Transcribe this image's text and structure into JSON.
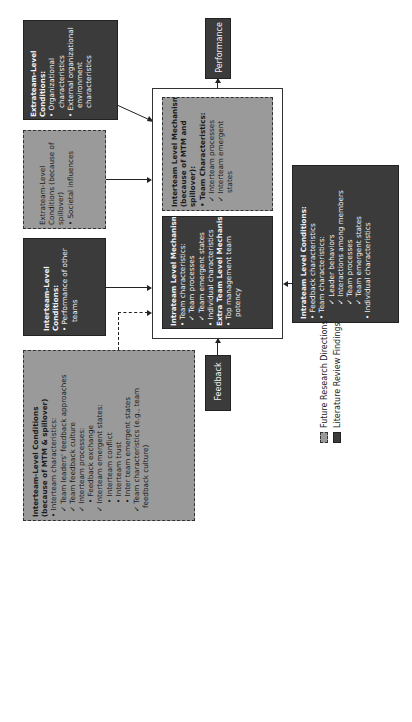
{
  "orientation": "rotated-90-ccw",
  "colors": {
    "literature_review_fill": "#3b3b3b",
    "future_research_fill": "#9a9a9a",
    "background": "#ffffff"
  },
  "outcome": {
    "label": "Performance"
  },
  "input": {
    "label": "Feedback"
  },
  "extrateam_conditions": {
    "title": "Extrateam-Level Conditions:",
    "items": [
      "• Organizational",
      "characteristics",
      "• External organizational",
      "environment",
      "characteristics"
    ]
  },
  "extrateam_spillover": {
    "title_1": "Extrateam-Level",
    "title_2": "Conditions (because of",
    "title_3": "spillover)",
    "items": [
      "• Societal influences"
    ]
  },
  "interteam_conditions": {
    "title_1": "Interteam-Level",
    "title_2": "Conditions:",
    "items": [
      "• Performance of other",
      "teams"
    ]
  },
  "interteam_mtm_conditions": {
    "title_1": "Interteam-Level Conditions",
    "title_2": "(because of MTM & spillover)",
    "items": [
      "• Interteam characteristics:",
      "✓ Team leaders' feedback approaches",
      "✓ Team feedback culture",
      "✓ Interteam processes:",
      "• Feedback exchange",
      "✓ Interteam emergent states:",
      "• Interteam conflict",
      "• Interteam trust",
      "• Inter team emergent states",
      "✓ Team characteristics (e.g., team",
      "feedback culture)"
    ]
  },
  "interteam_mechanisms": {
    "title_1": "Interteam Level Mechanisms",
    "title_2": "(because of MTM and",
    "title_3": "spillover):",
    "items": [
      "• Team Characteristics:",
      "✓ Interteam processes",
      "✓ Interteam emergent",
      "states"
    ]
  },
  "intrateam_mechanisms": {
    "title": "Intrateam Level Mechanisms:",
    "items": [
      "• Team characteristics:",
      "✓ Team processes",
      "✓ Team emergent states",
      "• Individual characteristics"
    ],
    "extra_title": "Extra Team Level Mechanism:",
    "extra_items": [
      "• Top management team",
      "potency"
    ]
  },
  "intrateam_conditions": {
    "title": "Intrateam Level Conditions:",
    "items": [
      "• Feedback characteristics",
      "• Team characteristics:",
      "✓ Leader behaviors",
      "✓ Interactions among members",
      "✓ Team processes",
      "✓ Team emergent states",
      "• Individual characteristics"
    ]
  },
  "legend": {
    "items": [
      {
        "label": "Future Research Directions",
        "style": "dashed-light"
      },
      {
        "label": "Literature Review Findings",
        "style": "solid-dark"
      }
    ]
  }
}
